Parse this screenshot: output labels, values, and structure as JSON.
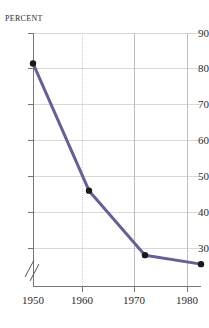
{
  "chart_data": {
    "type": "line",
    "title": "",
    "subtitle": "",
    "xlabel": "",
    "ylabel": "Percent",
    "x": [
      1950,
      1960,
      1970,
      1980
    ],
    "xtick_labels": [
      "1950",
      "1960",
      "1970",
      "1980"
    ],
    "values": [
      81.5,
      46.0,
      28.0,
      25.5
    ],
    "series": [
      {
        "name": "Percent",
        "values": [
          81.5,
          46.0,
          28.0,
          25.5
        ]
      }
    ],
    "ytick_labels": [
      "90",
      "80",
      "70",
      "60",
      "50",
      "40",
      "30"
    ],
    "ytick_values": [
      90,
      80,
      70,
      60,
      50,
      40,
      30
    ],
    "ylim": [
      24,
      90
    ],
    "xlim": [
      1950,
      1980
    ],
    "axis_break": true,
    "axis_break_location": "y-axis-below-30",
    "grid": true,
    "grid_horizontal": "solid",
    "grid_vertical": "dotted",
    "legend": "none",
    "line_color": "#6b5e94",
    "marker_color": "#1a1a1a",
    "marker_shape": "circle",
    "line_width": 3
  },
  "axis": {
    "y_label_text": "Percent"
  }
}
